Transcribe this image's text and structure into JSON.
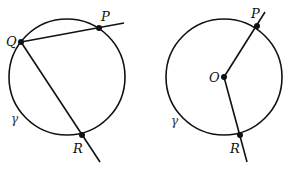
{
  "figures": [
    {
      "name": "inscribed-angle",
      "circle": {
        "cx": 67,
        "cy": 77,
        "r": 58
      },
      "circle_label": "γ",
      "points": [
        {
          "id": "Q",
          "label": "Q",
          "x": 21,
          "y": 42
        },
        {
          "id": "P",
          "label": "P",
          "x": 99,
          "y": 28
        },
        {
          "id": "R",
          "label": "R",
          "x": 82,
          "y": 135
        }
      ]
    },
    {
      "name": "central-angle",
      "circle": {
        "cx": 224,
        "cy": 77,
        "r": 58
      },
      "circle_label": "γ",
      "points": [
        {
          "id": "O",
          "label": "O",
          "x": 224,
          "y": 77
        },
        {
          "id": "P",
          "label": "P",
          "x": 257,
          "y": 26
        },
        {
          "id": "R",
          "label": "R",
          "x": 240,
          "y": 135
        }
      ]
    }
  ],
  "colors": {
    "stroke": "#111111",
    "background": "#ffffff"
  }
}
